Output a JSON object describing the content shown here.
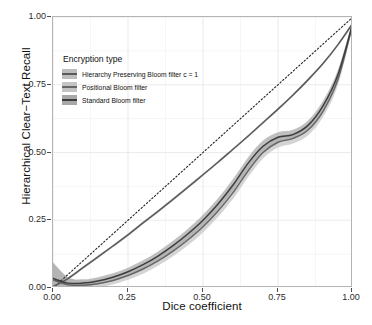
{
  "chart_data": {
    "type": "line",
    "title": "",
    "xlabel": "Dice coefficient",
    "ylabel": "Hierarchical Clear−Text Recall",
    "xlim": [
      0.0,
      1.0
    ],
    "ylim": [
      0.0,
      1.0
    ],
    "xticks": [
      "0.00",
      "0.25",
      "0.50",
      "0.75",
      "1.00"
    ],
    "yticks": [
      "0.00",
      "0.25",
      "0.50",
      "0.75",
      "1.00"
    ],
    "xtick_values": [
      0.0,
      0.25,
      0.5,
      0.75,
      1.0
    ],
    "ytick_values": [
      0.0,
      0.25,
      0.5,
      0.75,
      1.0
    ],
    "grid": true,
    "legend_position": "inset-top-left",
    "reference_line": {
      "name": "diagonal reference",
      "style": "dotted",
      "x": [
        0.0,
        1.0
      ],
      "y": [
        0.0,
        1.0
      ],
      "color": "#222222"
    },
    "series": [
      {
        "name": "Hierarchy Preserving Bloom filter c = 1",
        "color": "#5a5a5a",
        "x": [
          0.0,
          0.05,
          0.1,
          0.15,
          0.2,
          0.25,
          0.3,
          0.35,
          0.4,
          0.45,
          0.5,
          0.55,
          0.6,
          0.65,
          0.7,
          0.75,
          0.8,
          0.85,
          0.9,
          0.95,
          1.0
        ],
        "y": [
          0.005,
          0.035,
          0.075,
          0.115,
          0.155,
          0.196,
          0.24,
          0.283,
          0.327,
          0.372,
          0.418,
          0.464,
          0.512,
          0.56,
          0.61,
          0.66,
          0.712,
          0.768,
          0.828,
          0.898,
          0.978
        ],
        "band_lower": [
          0.0,
          0.03,
          0.07,
          0.11,
          0.15,
          0.191,
          0.235,
          0.278,
          0.322,
          0.367,
          0.413,
          0.459,
          0.507,
          0.555,
          0.605,
          0.655,
          0.707,
          0.763,
          0.823,
          0.893,
          0.973
        ],
        "band_upper": [
          0.012,
          0.04,
          0.08,
          0.12,
          0.16,
          0.201,
          0.245,
          0.288,
          0.332,
          0.377,
          0.423,
          0.469,
          0.517,
          0.565,
          0.615,
          0.665,
          0.717,
          0.773,
          0.833,
          0.903,
          0.983
        ]
      },
      {
        "name": "Positional Bloom filter",
        "color": "#666666",
        "x": [
          0.0,
          0.05,
          0.1,
          0.15,
          0.2,
          0.25,
          0.3,
          0.35,
          0.4,
          0.45,
          0.5,
          0.55,
          0.6,
          0.65,
          0.7,
          0.75,
          0.8,
          0.85,
          0.9,
          0.95,
          1.0
        ],
        "y": [
          0.03,
          0.012,
          0.01,
          0.016,
          0.028,
          0.046,
          0.07,
          0.1,
          0.136,
          0.178,
          0.226,
          0.284,
          0.352,
          0.432,
          0.5,
          0.538,
          0.552,
          0.583,
          0.652,
          0.77,
          0.978
        ],
        "band_lower": [
          0.0,
          0.0,
          0.0,
          0.002,
          0.013,
          0.03,
          0.053,
          0.082,
          0.117,
          0.158,
          0.205,
          0.262,
          0.329,
          0.409,
          0.478,
          0.518,
          0.533,
          0.563,
          0.631,
          0.75,
          0.968
        ],
        "band_upper": [
          0.09,
          0.038,
          0.028,
          0.032,
          0.045,
          0.063,
          0.088,
          0.119,
          0.156,
          0.199,
          0.248,
          0.307,
          0.376,
          0.456,
          0.523,
          0.559,
          0.572,
          0.604,
          0.674,
          0.791,
          0.99
        ]
      },
      {
        "name": "Standard Bloom filter",
        "color": "#3d3d3d",
        "x": [
          0.0,
          0.05,
          0.1,
          0.15,
          0.2,
          0.25,
          0.3,
          0.35,
          0.4,
          0.45,
          0.5,
          0.55,
          0.6,
          0.65,
          0.7,
          0.75,
          0.8,
          0.85,
          0.9,
          0.95,
          1.0
        ],
        "y": [
          0.035,
          0.018,
          0.018,
          0.026,
          0.04,
          0.06,
          0.086,
          0.118,
          0.156,
          0.2,
          0.25,
          0.31,
          0.38,
          0.46,
          0.523,
          0.556,
          0.566,
          0.6,
          0.672,
          0.788,
          0.98
        ],
        "band_lower": [
          0.0,
          0.004,
          0.006,
          0.014,
          0.027,
          0.046,
          0.071,
          0.102,
          0.139,
          0.182,
          0.231,
          0.29,
          0.359,
          0.439,
          0.503,
          0.538,
          0.549,
          0.582,
          0.653,
          0.77,
          0.97
        ],
        "band_upper": [
          0.095,
          0.04,
          0.032,
          0.04,
          0.054,
          0.075,
          0.102,
          0.135,
          0.174,
          0.219,
          0.27,
          0.331,
          0.402,
          0.482,
          0.544,
          0.575,
          0.584,
          0.618,
          0.691,
          0.806,
          0.992
        ]
      }
    ]
  },
  "legend": {
    "title": "Encryption type",
    "entries": [
      {
        "label": "Hierarchy Preserving Bloom filter c = 1",
        "color": "#5a5a5a",
        "band": "#bdbdbd"
      },
      {
        "label": "Positional Bloom filter",
        "color": "#666666",
        "band": "#c4c4c4"
      },
      {
        "label": "Standard Bloom filter",
        "color": "#3d3d3d",
        "band": "#a8a8a8"
      }
    ]
  },
  "axes": {
    "x_title": "Dice coefficient",
    "y_title": "Hierarchical Clear−Text Recall",
    "x_tick_labels": [
      "0.00",
      "0.25",
      "0.50",
      "0.75",
      "1.00"
    ],
    "y_tick_labels": [
      "0.00",
      "0.25",
      "0.50",
      "0.75",
      "1.00"
    ]
  },
  "style": {
    "panel_background": "#ffffff",
    "panel_border": "#b4b4b4",
    "grid_color": "#ebebeb",
    "text_color": "#111111"
  }
}
